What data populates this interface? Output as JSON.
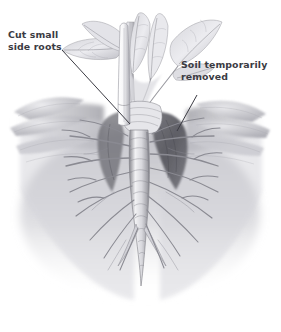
{
  "figure": {
    "kind": "botanical-pencil-illustration",
    "background_color": "#ffffff"
  },
  "annotations": {
    "cut_roots": {
      "line1": "Cut small",
      "line2": "side roots",
      "text_color": "#3b3b43",
      "leader": {
        "x1": 62,
        "y1": 50,
        "x2": 130,
        "y2": 124
      }
    },
    "soil_removed": {
      "line1": "Soil temporarily",
      "line2": "removed",
      "text_color": "#3b3b43",
      "leader": {
        "x1": 197,
        "y1": 95,
        "x2": 177,
        "y2": 131
      }
    }
  },
  "palette": {
    "graphite_dark": "#4c4c52",
    "graphite_mid": "#8d8d93",
    "graphite_light": "#c9c9ce",
    "soil_cavity": "#5d5d63",
    "paper": "#ffffff"
  },
  "chart_data": {
    "type": "diagram",
    "parts": [
      {
        "name": "foliage",
        "label": "leaves and petioles",
        "count": 7
      },
      {
        "name": "crown",
        "label": "banded crown at soil line"
      },
      {
        "name": "taproot",
        "label": "segmented taproot"
      },
      {
        "name": "lateral-roots",
        "label": "small side roots",
        "count": 22
      },
      {
        "name": "knife",
        "label": "blade cutting side roots"
      },
      {
        "name": "soil-cavity",
        "label": "excavated trench beside root"
      },
      {
        "name": "soil-mound",
        "label": "undisturbed soil surface"
      }
    ]
  }
}
